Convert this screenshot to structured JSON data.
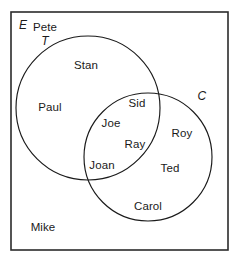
{
  "figure": {
    "type": "venn-diagram",
    "background_color": "#ffffff",
    "stroke_color": "#1a1a1a"
  },
  "universe": {
    "label": "E",
    "label_x": 23,
    "label_y": 25,
    "rect": {
      "x": 11,
      "y": 12,
      "width": 217,
      "height": 238
    }
  },
  "sets": [
    {
      "id": "T",
      "label": "T",
      "label_x": 45,
      "label_y": 41,
      "cx": 88,
      "cy": 108,
      "r": 72
    },
    {
      "id": "C",
      "label": "C",
      "label_x": 202,
      "label_y": 96,
      "cx": 148,
      "cy": 157,
      "r": 64
    }
  ],
  "members": [
    {
      "name": "Pete",
      "region": "outside-both",
      "x": 45,
      "y": 28
    },
    {
      "name": "Mike",
      "region": "outside-both",
      "x": 43,
      "y": 228
    },
    {
      "name": "Stan",
      "region": "T-only",
      "x": 86,
      "y": 66
    },
    {
      "name": "Paul",
      "region": "T-only",
      "x": 50,
      "y": 108
    },
    {
      "name": "Sid",
      "region": "T-and-C",
      "x": 137,
      "y": 104
    },
    {
      "name": "Joe",
      "region": "T-and-C",
      "x": 111,
      "y": 124
    },
    {
      "name": "Ray",
      "region": "T-and-C",
      "x": 135,
      "y": 145
    },
    {
      "name": "Joan",
      "region": "T-and-C",
      "x": 102,
      "y": 166
    },
    {
      "name": "Roy",
      "region": "C-only",
      "x": 182,
      "y": 134
    },
    {
      "name": "Ted",
      "region": "C-only",
      "x": 170,
      "y": 169
    },
    {
      "name": "Carol",
      "region": "C-only",
      "x": 148,
      "y": 207
    }
  ]
}
